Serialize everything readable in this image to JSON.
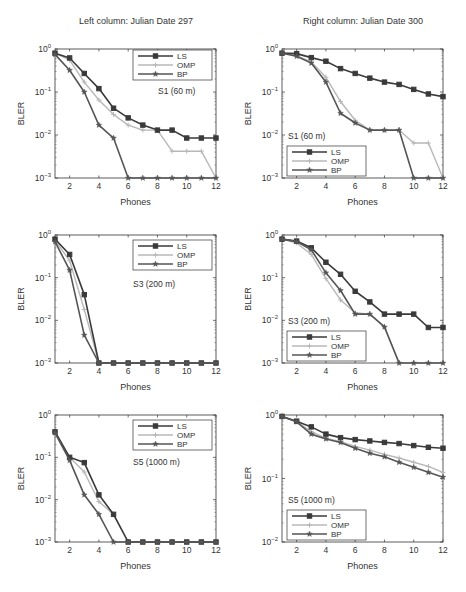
{
  "titles": {
    "left": "Left column: Julian Date 297",
    "right": "Right column: Julian Date 300"
  },
  "chart_data": [
    {
      "type": "line",
      "panel": "top-left",
      "annotation": "S1 (60 m)",
      "xlabel": "Phones",
      "ylabel": "BLER",
      "yscale": "log",
      "xlim": [
        1,
        12
      ],
      "ylim": [
        0.001,
        1
      ],
      "xticks": [
        2,
        4,
        6,
        8,
        10,
        12
      ],
      "yticks": [
        "10^-3",
        "10^-2",
        "10^-1",
        "10^0"
      ],
      "legend_position": "upper right",
      "x": [
        1,
        2,
        3,
        4,
        5,
        6,
        7,
        8,
        9,
        10,
        11,
        12
      ],
      "series": [
        {
          "name": "LS",
          "values": [
            0.8,
            0.62,
            0.27,
            0.12,
            0.042,
            0.025,
            0.017,
            0.013,
            0.013,
            0.0085,
            0.0085,
            0.0085
          ]
        },
        {
          "name": "OMP",
          "values": [
            0.8,
            0.55,
            0.17,
            0.065,
            0.03,
            0.017,
            0.013,
            0.013,
            0.0042,
            0.0042,
            0.0042,
            0.001
          ]
        },
        {
          "name": "BP",
          "values": [
            0.75,
            0.32,
            0.1,
            0.017,
            0.0085,
            0.001,
            0.001,
            0.001,
            0.001,
            0.001,
            0.001,
            0.001
          ]
        }
      ]
    },
    {
      "type": "line",
      "panel": "top-right",
      "annotation": "S1 (60 m)",
      "xlabel": "Phones",
      "ylabel": "BLER",
      "yscale": "log",
      "xlim": [
        1,
        12
      ],
      "ylim": [
        0.001,
        1
      ],
      "xticks": [
        2,
        4,
        6,
        8,
        10,
        12
      ],
      "yticks": [
        "10^-3",
        "10^-2",
        "10^-1",
        "10^0"
      ],
      "legend_position": "lower left",
      "x": [
        1,
        2,
        3,
        4,
        5,
        6,
        7,
        8,
        9,
        10,
        11,
        12
      ],
      "series": [
        {
          "name": "LS",
          "values": [
            0.8,
            0.78,
            0.63,
            0.52,
            0.35,
            0.27,
            0.21,
            0.17,
            0.15,
            0.115,
            0.09,
            0.078
          ]
        },
        {
          "name": "OMP",
          "values": [
            0.8,
            0.7,
            0.5,
            0.22,
            0.06,
            0.022,
            0.013,
            0.013,
            0.013,
            0.0065,
            0.0065,
            0.001
          ]
        },
        {
          "name": "BP",
          "values": [
            0.8,
            0.68,
            0.47,
            0.17,
            0.032,
            0.019,
            0.013,
            0.013,
            0.013,
            0.001,
            0.001,
            0.001
          ]
        }
      ]
    },
    {
      "type": "line",
      "panel": "middle-left",
      "annotation": "S3 (200 m)",
      "xlabel": "Phones",
      "ylabel": "BLER",
      "yscale": "log",
      "xlim": [
        1,
        12
      ],
      "ylim": [
        0.001,
        1
      ],
      "xticks": [
        2,
        4,
        6,
        8,
        10,
        12
      ],
      "yticks": [
        "10^-3",
        "10^-2",
        "10^-1",
        "10^0"
      ],
      "legend_position": "upper right",
      "x": [
        1,
        2,
        3,
        4,
        5,
        6,
        7,
        8,
        9,
        10,
        11,
        12
      ],
      "series": [
        {
          "name": "LS",
          "values": [
            0.8,
            0.35,
            0.04,
            0.001,
            0.001,
            0.001,
            0.001,
            0.001,
            0.001,
            0.001,
            0.001,
            0.001
          ]
        },
        {
          "name": "OMP",
          "values": [
            0.75,
            0.25,
            0.018,
            0.001,
            0.001,
            0.001,
            0.001,
            0.001,
            0.001,
            0.001,
            0.001,
            0.001
          ]
        },
        {
          "name": "BP",
          "values": [
            0.7,
            0.15,
            0.0045,
            0.001,
            0.001,
            0.001,
            0.001,
            0.001,
            0.001,
            0.001,
            0.001,
            0.001
          ]
        }
      ]
    },
    {
      "type": "line",
      "panel": "middle-right",
      "annotation": "S3 (200 m)",
      "xlabel": "Phones",
      "ylabel": "BLER",
      "yscale": "log",
      "xlim": [
        1,
        12
      ],
      "ylim": [
        0.001,
        1
      ],
      "xticks": [
        2,
        4,
        6,
        8,
        10,
        12
      ],
      "yticks": [
        "10^-3",
        "10^-2",
        "10^-1",
        "10^0"
      ],
      "legend_position": "lower left",
      "x": [
        1,
        2,
        3,
        4,
        5,
        6,
        7,
        8,
        9,
        10,
        11,
        12
      ],
      "series": [
        {
          "name": "LS",
          "values": [
            0.8,
            0.72,
            0.5,
            0.23,
            0.12,
            0.048,
            0.027,
            0.014,
            0.014,
            0.014,
            0.0068,
            0.0068
          ]
        },
        {
          "name": "OMP",
          "values": [
            0.8,
            0.65,
            0.35,
            0.095,
            0.03,
            0.015,
            0.014,
            0.007,
            0.001,
            0.001,
            0.001,
            0.001
          ]
        },
        {
          "name": "BP",
          "values": [
            0.8,
            0.7,
            0.45,
            0.13,
            0.05,
            0.014,
            0.014,
            0.007,
            0.001,
            0.001,
            0.001,
            0.001
          ]
        }
      ]
    },
    {
      "type": "line",
      "panel": "bottom-left",
      "annotation": "S5 (1000 m)",
      "xlabel": "Phones",
      "ylabel": "BLER",
      "yscale": "log",
      "xlim": [
        1,
        12
      ],
      "ylim": [
        0.001,
        1
      ],
      "xticks": [
        2,
        4,
        6,
        8,
        10,
        12
      ],
      "yticks": [
        "10^-3",
        "10^-2",
        "10^-1",
        "10^0"
      ],
      "legend_position": "upper right",
      "x": [
        1,
        2,
        3,
        4,
        5,
        6,
        7,
        8,
        9,
        10,
        11,
        12
      ],
      "series": [
        {
          "name": "LS",
          "values": [
            0.4,
            0.1,
            0.075,
            0.013,
            0.0045,
            0.001,
            0.001,
            0.001,
            0.001,
            0.001,
            0.001,
            0.001
          ]
        },
        {
          "name": "OMP",
          "values": [
            0.42,
            0.1,
            0.045,
            0.009,
            0.0045,
            0.001,
            0.001,
            0.001,
            0.001,
            0.001,
            0.001,
            0.001
          ]
        },
        {
          "name": "BP",
          "values": [
            0.38,
            0.085,
            0.013,
            0.0045,
            0.001,
            0.001,
            0.001,
            0.001,
            0.001,
            0.001,
            0.001,
            0.001
          ]
        }
      ]
    },
    {
      "type": "line",
      "panel": "bottom-right",
      "annotation": "S5 (1000 m)",
      "xlabel": "Phones",
      "ylabel": "BLER",
      "yscale": "log",
      "xlim": [
        1,
        12
      ],
      "ylim": [
        0.01,
        1
      ],
      "xticks": [
        2,
        4,
        6,
        8,
        10,
        12
      ],
      "yticks": [
        "10^-2",
        "10^-1",
        "10^0"
      ],
      "legend_position": "lower left",
      "x": [
        1,
        2,
        3,
        4,
        5,
        6,
        7,
        8,
        9,
        10,
        11,
        12
      ],
      "series": [
        {
          "name": "LS",
          "values": [
            0.95,
            0.8,
            0.65,
            0.5,
            0.44,
            0.41,
            0.39,
            0.37,
            0.355,
            0.33,
            0.31,
            0.3
          ]
        },
        {
          "name": "OMP",
          "values": [
            0.95,
            0.78,
            0.55,
            0.43,
            0.38,
            0.32,
            0.28,
            0.24,
            0.21,
            0.18,
            0.155,
            0.125
          ]
        },
        {
          "name": "BP",
          "values": [
            0.95,
            0.78,
            0.5,
            0.42,
            0.37,
            0.3,
            0.25,
            0.22,
            0.18,
            0.15,
            0.125,
            0.105
          ]
        }
      ]
    }
  ],
  "styles": {
    "LS": {
      "color": "#3a3a3a",
      "marker": "square",
      "width": 1.6
    },
    "OMP": {
      "color": "#b8b8b8",
      "marker": "plus",
      "width": 1.4
    },
    "BP": {
      "color": "#555555",
      "marker": "star",
      "width": 1.6
    }
  },
  "layout": {
    "panels": [
      {
        "x0": 55,
        "x1": 216,
        "y0": 49,
        "y1": 178,
        "legend": {
          "x": 133,
          "y": 50,
          "w": 79,
          "h": 30
        },
        "annot": {
          "x": 158,
          "y": 94
        }
      },
      {
        "x0": 282,
        "x1": 443,
        "y0": 49,
        "y1": 178,
        "legend": {
          "x": 287,
          "y": 146,
          "w": 79,
          "h": 30
        },
        "annot": {
          "x": 288,
          "y": 139
        }
      },
      {
        "x0": 55,
        "x1": 216,
        "y0": 235,
        "y1": 363,
        "legend": {
          "x": 133,
          "y": 240,
          "w": 79,
          "h": 30
        },
        "annot": {
          "x": 133,
          "y": 287
        }
      },
      {
        "x0": 282,
        "x1": 443,
        "y0": 235,
        "y1": 363,
        "legend": {
          "x": 287,
          "y": 331,
          "w": 79,
          "h": 30
        },
        "annot": {
          "x": 288,
          "y": 324
        }
      },
      {
        "x0": 55,
        "x1": 216,
        "y0": 415,
        "y1": 542,
        "legend": {
          "x": 133,
          "y": 420,
          "w": 79,
          "h": 30
        },
        "annot": {
          "x": 133,
          "y": 465
        }
      },
      {
        "x0": 282,
        "x1": 443,
        "y0": 415,
        "y1": 542,
        "legend": {
          "x": 287,
          "y": 510,
          "w": 79,
          "h": 30
        },
        "annot": {
          "x": 288,
          "y": 503
        }
      }
    ]
  }
}
